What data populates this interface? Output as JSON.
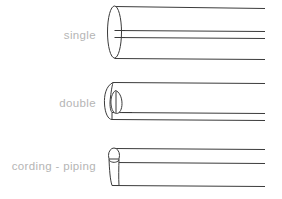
{
  "diagram": {
    "background_color": "#ffffff",
    "line_color": "#3b3b3b",
    "label_color": "#b5b5b5",
    "rows": [
      {
        "id": "single",
        "label": "single",
        "art_name": "single-welt-drawing",
        "description": "Single folded welt shown in perspective with an elliptical end cap and four receding edge lines."
      },
      {
        "id": "double",
        "label": "double",
        "art_name": "double-welt-drawing",
        "description": "Double folded welt shown in perspective with a rolled end and inner tongue fold, three receding edge lines."
      },
      {
        "id": "cording",
        "label": "cording - piping",
        "art_name": "cording-piping-drawing",
        "description": "Corded piping shown in perspective with a small round cord at the top and a flat seam flange below, three receding edge lines."
      }
    ]
  }
}
